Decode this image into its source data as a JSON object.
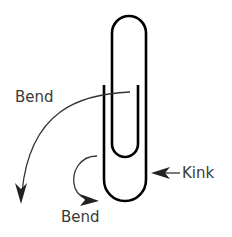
{
  "diagram": {
    "labels": {
      "bend_top": "Bend",
      "bend_bottom": "Bend",
      "kink": "Kink"
    },
    "colors": {
      "wire": "#000000",
      "arrow": "#333333",
      "text": "#3a3a3a",
      "background": "#ffffff"
    },
    "annotations": [
      {
        "label": "Bend",
        "type": "curved-arrow",
        "direction": "down-left"
      },
      {
        "label": "Bend",
        "type": "curved-arrow",
        "direction": "curl-right"
      },
      {
        "label": "Kink",
        "type": "straight-arrow",
        "direction": "left"
      }
    ]
  }
}
